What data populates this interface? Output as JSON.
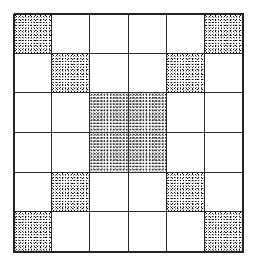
{
  "figure": {
    "canvas": {
      "width": 253,
      "height": 261,
      "background_color": "#ffffff"
    },
    "grid": {
      "rows": 6,
      "columns": 6,
      "left": 14,
      "top": 14,
      "width": 229,
      "height": 238,
      "cell_width": 38,
      "cell_height": 39,
      "line_color": "#2b2b2b",
      "line_width": 1.3,
      "frame_color": "#242424",
      "frame_width": 1.7
    },
    "fill": {
      "shaded_color": "#111111",
      "blank_color": "#ffffff",
      "texture": "random-stipple",
      "approx_density_percent": 48
    },
    "pattern_name": "X / double diagonal",
    "shaded_count": 12,
    "blank_count": 24,
    "shaded_cells": [
      [
        0,
        0
      ],
      [
        0,
        5
      ],
      [
        1,
        1
      ],
      [
        1,
        4
      ],
      [
        2,
        2
      ],
      [
        2,
        3
      ],
      [
        3,
        2
      ],
      [
        3,
        3
      ],
      [
        4,
        1
      ],
      [
        4,
        4
      ],
      [
        5,
        0
      ],
      [
        5,
        5
      ]
    ],
    "cells": [
      [
        {
          "row": 0,
          "col": 0,
          "shaded": true,
          "light": false
        },
        {
          "row": 0,
          "col": 1,
          "shaded": false,
          "light": false
        },
        {
          "row": 0,
          "col": 2,
          "shaded": false,
          "light": false
        },
        {
          "row": 0,
          "col": 3,
          "shaded": false,
          "light": false
        },
        {
          "row": 0,
          "col": 4,
          "shaded": false,
          "light": false
        },
        {
          "row": 0,
          "col": 5,
          "shaded": true,
          "light": false
        }
      ],
      [
        {
          "row": 1,
          "col": 0,
          "shaded": false,
          "light": false
        },
        {
          "row": 1,
          "col": 1,
          "shaded": true,
          "light": false
        },
        {
          "row": 1,
          "col": 2,
          "shaded": false,
          "light": false
        },
        {
          "row": 1,
          "col": 3,
          "shaded": false,
          "light": false
        },
        {
          "row": 1,
          "col": 4,
          "shaded": true,
          "light": false
        },
        {
          "row": 1,
          "col": 5,
          "shaded": false,
          "light": false
        }
      ],
      [
        {
          "row": 2,
          "col": 0,
          "shaded": false,
          "light": false
        },
        {
          "row": 2,
          "col": 1,
          "shaded": false,
          "light": false
        },
        {
          "row": 2,
          "col": 2,
          "shaded": true,
          "light": true
        },
        {
          "row": 2,
          "col": 3,
          "shaded": true,
          "light": true
        },
        {
          "row": 2,
          "col": 4,
          "shaded": false,
          "light": false
        },
        {
          "row": 2,
          "col": 5,
          "shaded": false,
          "light": false
        }
      ],
      [
        {
          "row": 3,
          "col": 0,
          "shaded": false,
          "light": false
        },
        {
          "row": 3,
          "col": 1,
          "shaded": false,
          "light": false
        },
        {
          "row": 3,
          "col": 2,
          "shaded": true,
          "light": true
        },
        {
          "row": 3,
          "col": 3,
          "shaded": true,
          "light": true
        },
        {
          "row": 3,
          "col": 4,
          "shaded": false,
          "light": false
        },
        {
          "row": 3,
          "col": 5,
          "shaded": false,
          "light": false
        }
      ],
      [
        {
          "row": 4,
          "col": 0,
          "shaded": false,
          "light": false
        },
        {
          "row": 4,
          "col": 1,
          "shaded": true,
          "light": false
        },
        {
          "row": 4,
          "col": 2,
          "shaded": false,
          "light": false
        },
        {
          "row": 4,
          "col": 3,
          "shaded": false,
          "light": false
        },
        {
          "row": 4,
          "col": 4,
          "shaded": true,
          "light": false
        },
        {
          "row": 4,
          "col": 5,
          "shaded": false,
          "light": false
        }
      ],
      [
        {
          "row": 5,
          "col": 0,
          "shaded": true,
          "light": false
        },
        {
          "row": 5,
          "col": 1,
          "shaded": false,
          "light": false
        },
        {
          "row": 5,
          "col": 2,
          "shaded": false,
          "light": false
        },
        {
          "row": 5,
          "col": 3,
          "shaded": false,
          "light": false
        },
        {
          "row": 5,
          "col": 4,
          "shaded": false,
          "light": false
        },
        {
          "row": 5,
          "col": 5,
          "shaded": true,
          "light": false
        }
      ]
    ]
  }
}
